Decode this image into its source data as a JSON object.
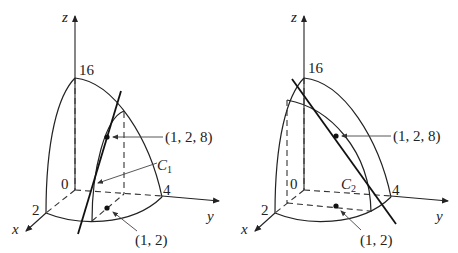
{
  "figures": [
    {
      "id": "left",
      "axes": {
        "x_label": "x",
        "y_label": "y",
        "z_label": "z"
      },
      "ticks": {
        "origin": "0",
        "x_tick": "2",
        "y_tick": "4",
        "z_tick": "16"
      },
      "curve_label": {
        "main": "C",
        "sub": "1"
      },
      "point_3d_label": "(1, 2, 8)",
      "point_2d_label": "(1, 2)"
    },
    {
      "id": "right",
      "axes": {
        "x_label": "x",
        "y_label": "y",
        "z_label": "z"
      },
      "ticks": {
        "origin": "0",
        "x_tick": "2",
        "y_tick": "4",
        "z_tick": "16"
      },
      "curve_label": {
        "main": "C",
        "sub": "2"
      },
      "point_3d_label": "(1, 2, 8)",
      "point_2d_label": "(1, 2)"
    }
  ]
}
